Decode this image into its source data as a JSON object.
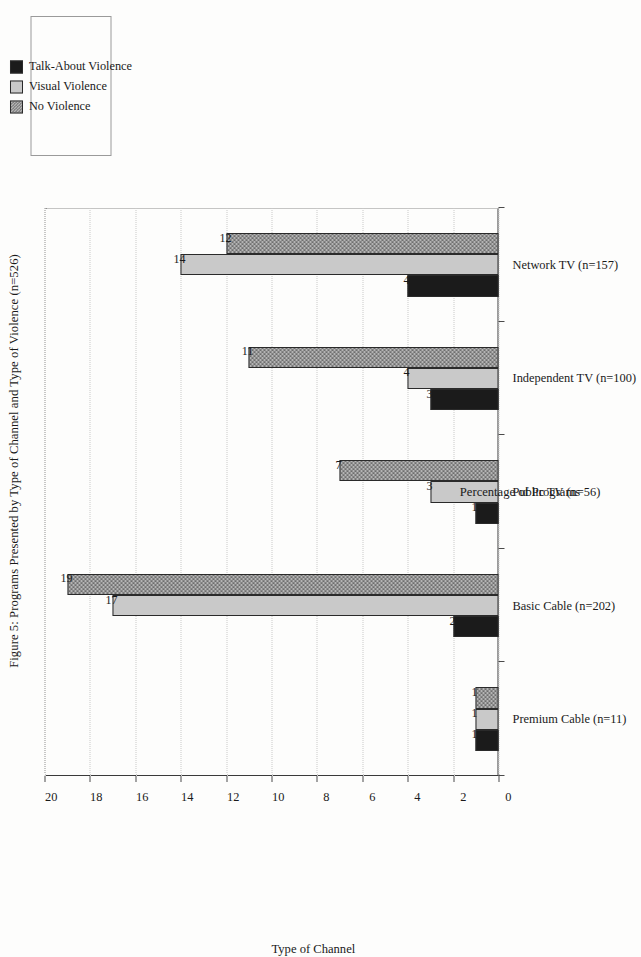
{
  "figure": {
    "caption": "Figure 5: Programs Presented by Type of Channel and Type of Violence (n=526)",
    "page_width": 585,
    "page_height": 922,
    "orientation": "rotated-90-ccw",
    "background_color": "#fdfdfc",
    "frame_color": "#8d8d8d"
  },
  "legend": {
    "position": "top-right",
    "items": [
      {
        "label": "Talk-About Violence",
        "color": "#1b1b1b",
        "fill": "solid"
      },
      {
        "label": "Visual Violence",
        "color": "#c9c9c9",
        "fill": "solid"
      },
      {
        "label": "No Violence",
        "color": "#b4b4b4",
        "fill": "checkered"
      }
    ]
  },
  "chart_data": {
    "type": "bar",
    "title": "Figure 5: Programs Presented by Type of Channel and Type of Violence (n=526)",
    "xlabel": "Type of Channel",
    "ylabel": "Percentage of Programs",
    "ylim": [
      0,
      20
    ],
    "yticks": [
      0,
      2,
      4,
      6,
      8,
      10,
      12,
      14,
      16,
      18,
      20
    ],
    "ytick_labels": [
      "0",
      "2",
      "4",
      "6",
      "8",
      "10",
      "12",
      "14",
      "16",
      "18",
      "20"
    ],
    "grid": false,
    "legend_position": "top-right",
    "data_labels": true,
    "categories": [
      "Premium Cable (n=11)",
      "Basic Cable (n=202)",
      "Public TV (n=56)",
      "Independent TV (n=100)",
      "Network TV (n=157)"
    ],
    "series": [
      {
        "name": "Talk-About Violence",
        "color": "#1b1b1b",
        "values": [
          1,
          2,
          1,
          3,
          4
        ]
      },
      {
        "name": "Visual Violence",
        "color": "#c9c9c9",
        "values": [
          1,
          17,
          3,
          4,
          14
        ]
      },
      {
        "name": "No Violence",
        "color": "#b4b4b4",
        "values": [
          1,
          19,
          7,
          11,
          12
        ]
      }
    ]
  }
}
